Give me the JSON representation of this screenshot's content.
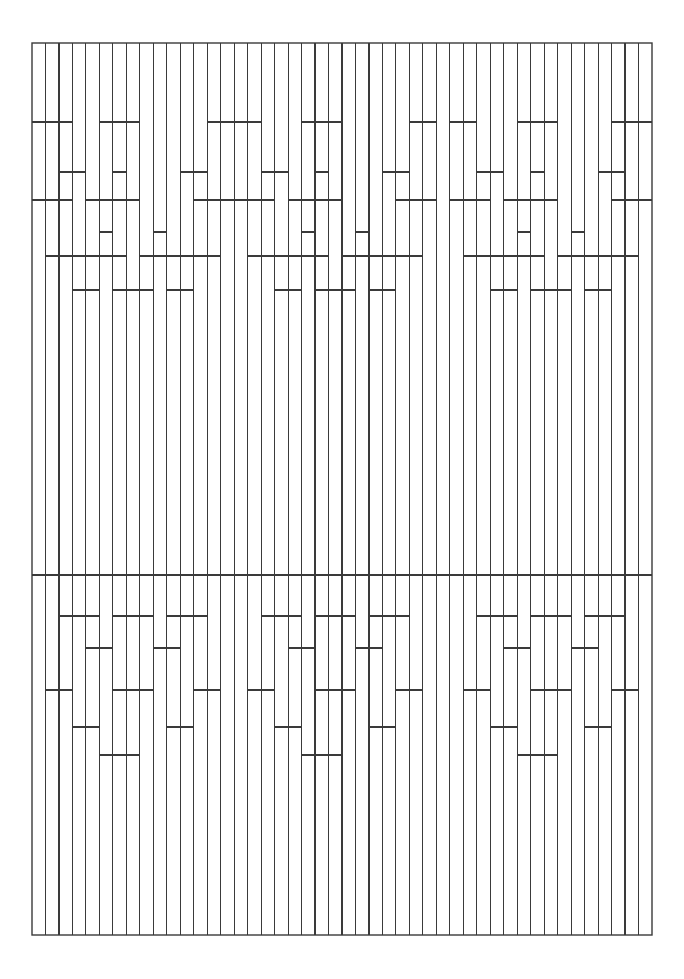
{
  "artwork": {
    "title": "Abstract Vertical Line Lattice Pattern",
    "description": "Monochrome line drawing of a dense field of vertical strokes interrupted by rectilinear stepped motifs, bounded by a thin rectangular frame.",
    "style": "geometric-line-art",
    "canvas": {
      "width": 684,
      "height": 979,
      "background": "#ffffff"
    },
    "frame": {
      "x": 32,
      "y": 43,
      "width": 620,
      "height": 892,
      "stroke": "#3a3a3a",
      "stroke_width": 1.4,
      "fill": "none"
    },
    "stroke": {
      "color": "#3a3a3a",
      "width": 1.1,
      "cap": "butt"
    },
    "grid": {
      "columns": 46,
      "column_spacing": 13.478,
      "origin_x": 32,
      "origin_y": 43,
      "right_x": 652,
      "bottom_y": 935
    },
    "bands": {
      "top_zone": {
        "from": 43,
        "to": 316
      },
      "middle_zone": {
        "from": 316,
        "to": 600
      },
      "bottom_zone": {
        "from": 600,
        "to": 935
      }
    },
    "horizontal_rules": [
      122,
      172,
      200,
      232,
      256,
      290,
      575,
      616,
      648,
      690,
      727,
      755
    ],
    "motif": {
      "count": 3,
      "period": 206.7,
      "mirror_symmetric": true,
      "name": "stepped-comb-motif"
    },
    "chart_data": {
      "type": "line",
      "title": "Abstract Vertical Line Lattice Pattern",
      "xlabel": "",
      "ylabel": "",
      "xlim": [
        32,
        652
      ],
      "ylim": [
        43,
        935
      ],
      "grid": false,
      "legend": "none",
      "series": [
        {
          "name": "frame",
          "values": []
        },
        {
          "name": "vertical-strokes",
          "values": []
        },
        {
          "name": "horizontal-connectors",
          "values": []
        }
      ]
    }
  }
}
